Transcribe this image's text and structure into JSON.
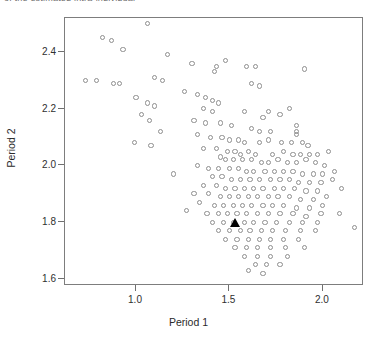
{
  "top_text": {
    "cut_off_line": "of the estimated intra-individual"
  },
  "figure": {
    "plot_box": {
      "left": 64,
      "top": 17,
      "width": 299,
      "height": 268
    }
  },
  "chart_data": {
    "type": "scatter",
    "title": "",
    "xlabel": "Period 1",
    "ylabel": "Period 2",
    "xlim": [
      0.62,
      2.22
    ],
    "ylim": [
      1.575,
      2.52
    ],
    "xticks": [
      1.0,
      1.5,
      2.0
    ],
    "xticklabels": [
      "1.0",
      "1.5",
      "2.0"
    ],
    "yticks": [
      1.6,
      1.8,
      2.0,
      2.2,
      2.4
    ],
    "yticklabels": [
      "1.6",
      "1.8",
      "2.0",
      "2.2",
      "2.4"
    ],
    "grid": false,
    "legend": null,
    "series": [
      {
        "name": "observations",
        "marker": "open-circle",
        "color": "#8e8e8e",
        "points": [
          [
            1.06,
            2.5
          ],
          [
            0.82,
            2.45
          ],
          [
            0.87,
            2.44
          ],
          [
            0.93,
            2.41
          ],
          [
            1.17,
            2.39
          ],
          [
            1.48,
            2.37
          ],
          [
            1.3,
            2.36
          ],
          [
            1.43,
            2.35
          ],
          [
            1.59,
            2.35
          ],
          [
            1.64,
            2.35
          ],
          [
            1.9,
            2.34
          ],
          [
            1.42,
            2.33
          ],
          [
            0.73,
            2.3
          ],
          [
            0.79,
            2.3
          ],
          [
            0.88,
            2.29
          ],
          [
            0.91,
            2.29
          ],
          [
            1.1,
            2.31
          ],
          [
            1.14,
            2.3
          ],
          [
            1.62,
            2.29
          ],
          [
            1.66,
            2.28
          ],
          [
            1.26,
            2.26
          ],
          [
            1.33,
            2.25
          ],
          [
            1.37,
            2.24
          ],
          [
            1.41,
            2.23
          ],
          [
            1.44,
            2.22
          ],
          [
            1.0,
            2.24
          ],
          [
            1.06,
            2.22
          ],
          [
            1.1,
            2.21
          ],
          [
            1.36,
            2.2
          ],
          [
            1.41,
            2.19
          ],
          [
            1.58,
            2.19
          ],
          [
            1.71,
            2.19
          ],
          [
            1.68,
            2.17
          ],
          [
            1.77,
            2.18
          ],
          [
            1.82,
            2.2
          ],
          [
            1.03,
            2.18
          ],
          [
            1.07,
            2.16
          ],
          [
            1.31,
            2.16
          ],
          [
            1.37,
            2.15
          ],
          [
            1.45,
            2.15
          ],
          [
            1.51,
            2.14
          ],
          [
            1.62,
            2.13
          ],
          [
            1.66,
            2.12
          ],
          [
            1.72,
            2.12
          ],
          [
            1.86,
            2.14
          ],
          [
            1.86,
            2.12
          ],
          [
            1.86,
            2.11
          ],
          [
            1.13,
            2.12
          ],
          [
            1.33,
            2.11
          ],
          [
            1.4,
            2.1
          ],
          [
            1.46,
            2.1
          ],
          [
            1.5,
            2.09
          ],
          [
            1.55,
            2.09
          ],
          [
            1.58,
            2.08
          ],
          [
            1.66,
            2.08
          ],
          [
            1.71,
            2.09
          ],
          [
            1.78,
            2.08
          ],
          [
            1.83,
            2.08
          ],
          [
            1.89,
            2.08
          ],
          [
            1.92,
            2.07
          ],
          [
            0.99,
            2.08
          ],
          [
            1.08,
            2.07
          ],
          [
            1.36,
            2.06
          ],
          [
            1.43,
            2.06
          ],
          [
            1.49,
            2.05
          ],
          [
            1.53,
            2.05
          ],
          [
            1.56,
            2.04
          ],
          [
            1.6,
            2.05
          ],
          [
            1.64,
            2.04
          ],
          [
            1.73,
            2.04
          ],
          [
            1.79,
            2.05
          ],
          [
            1.84,
            2.04
          ],
          [
            1.88,
            2.04
          ],
          [
            1.93,
            2.04
          ],
          [
            1.97,
            2.04
          ],
          [
            2.03,
            2.05
          ],
          [
            1.45,
            2.03
          ],
          [
            1.48,
            2.02
          ],
          [
            1.52,
            2.02
          ],
          [
            1.57,
            2.02
          ],
          [
            1.62,
            2.02
          ],
          [
            1.67,
            2.01
          ],
          [
            1.71,
            2.01
          ],
          [
            1.76,
            2.02
          ],
          [
            1.81,
            2.01
          ],
          [
            1.86,
            2.01
          ],
          [
            1.91,
            2.02
          ],
          [
            1.96,
            2.01
          ],
          [
            2.01,
            2.0
          ],
          [
            1.33,
            2.0
          ],
          [
            1.39,
            1.99
          ],
          [
            1.44,
            1.99
          ],
          [
            1.5,
            1.99
          ],
          [
            1.55,
            1.99
          ],
          [
            1.59,
            1.98
          ],
          [
            1.63,
            1.98
          ],
          [
            1.69,
            1.98
          ],
          [
            1.74,
            1.98
          ],
          [
            1.79,
            1.98
          ],
          [
            1.84,
            1.98
          ],
          [
            1.89,
            1.97
          ],
          [
            1.95,
            1.97
          ],
          [
            2.0,
            1.97
          ],
          [
            2.06,
            1.98
          ],
          [
            1.2,
            1.97
          ],
          [
            1.41,
            1.96
          ],
          [
            1.46,
            1.96
          ],
          [
            1.51,
            1.95
          ],
          [
            1.56,
            1.95
          ],
          [
            1.61,
            1.95
          ],
          [
            1.66,
            1.95
          ],
          [
            1.72,
            1.95
          ],
          [
            1.77,
            1.95
          ],
          [
            1.82,
            1.95
          ],
          [
            1.87,
            1.94
          ],
          [
            1.93,
            1.94
          ],
          [
            1.99,
            1.94
          ],
          [
            2.05,
            1.95
          ],
          [
            1.36,
            1.93
          ],
          [
            1.43,
            1.93
          ],
          [
            1.48,
            1.92
          ],
          [
            1.53,
            1.92
          ],
          [
            1.58,
            1.92
          ],
          [
            1.63,
            1.92
          ],
          [
            1.68,
            1.92
          ],
          [
            1.74,
            1.92
          ],
          [
            1.79,
            1.92
          ],
          [
            1.85,
            1.92
          ],
          [
            1.91,
            1.91
          ],
          [
            1.97,
            1.91
          ],
          [
            2.1,
            1.92
          ],
          [
            1.31,
            1.9
          ],
          [
            1.39,
            1.9
          ],
          [
            1.45,
            1.89
          ],
          [
            1.5,
            1.89
          ],
          [
            1.55,
            1.89
          ],
          [
            1.6,
            1.89
          ],
          [
            1.65,
            1.89
          ],
          [
            1.71,
            1.89
          ],
          [
            1.76,
            1.89
          ],
          [
            1.82,
            1.89
          ],
          [
            1.88,
            1.88
          ],
          [
            1.95,
            1.88
          ],
          [
            2.02,
            1.89
          ],
          [
            1.34,
            1.87
          ],
          [
            1.42,
            1.86
          ],
          [
            1.47,
            1.86
          ],
          [
            1.52,
            1.86
          ],
          [
            1.57,
            1.86
          ],
          [
            1.62,
            1.86
          ],
          [
            1.68,
            1.86
          ],
          [
            1.73,
            1.86
          ],
          [
            1.79,
            1.86
          ],
          [
            1.86,
            1.85
          ],
          [
            1.93,
            1.85
          ],
          [
            2.0,
            1.86
          ],
          [
            1.27,
            1.84
          ],
          [
            1.38,
            1.83
          ],
          [
            1.44,
            1.83
          ],
          [
            1.49,
            1.83
          ],
          [
            1.54,
            1.83
          ],
          [
            1.59,
            1.83
          ],
          [
            1.65,
            1.83
          ],
          [
            1.71,
            1.83
          ],
          [
            1.77,
            1.83
          ],
          [
            1.84,
            1.83
          ],
          [
            1.91,
            1.82
          ],
          [
            1.99,
            1.83
          ],
          [
            2.09,
            1.83
          ],
          [
            1.41,
            1.8
          ],
          [
            1.47,
            1.8
          ],
          [
            1.52,
            1.8
          ],
          [
            1.58,
            1.8
          ],
          [
            1.63,
            1.8
          ],
          [
            1.69,
            1.8
          ],
          [
            1.75,
            1.8
          ],
          [
            1.82,
            1.8
          ],
          [
            1.89,
            1.8
          ],
          [
            1.97,
            1.8
          ],
          [
            1.44,
            1.77
          ],
          [
            1.5,
            1.77
          ],
          [
            1.56,
            1.77
          ],
          [
            1.61,
            1.77
          ],
          [
            1.67,
            1.77
          ],
          [
            1.73,
            1.77
          ],
          [
            1.8,
            1.77
          ],
          [
            1.88,
            1.77
          ],
          [
            1.96,
            1.77
          ],
          [
            2.17,
            1.78
          ],
          [
            1.48,
            1.74
          ],
          [
            1.54,
            1.74
          ],
          [
            1.6,
            1.74
          ],
          [
            1.66,
            1.74
          ],
          [
            1.72,
            1.74
          ],
          [
            1.79,
            1.74
          ],
          [
            1.87,
            1.74
          ],
          [
            1.53,
            1.71
          ],
          [
            1.59,
            1.71
          ],
          [
            1.65,
            1.71
          ],
          [
            1.72,
            1.71
          ],
          [
            1.8,
            1.71
          ],
          [
            1.9,
            1.71
          ],
          [
            1.58,
            1.68
          ],
          [
            1.65,
            1.68
          ],
          [
            1.72,
            1.68
          ],
          [
            1.81,
            1.68
          ],
          [
            1.64,
            1.65
          ],
          [
            1.7,
            1.65
          ],
          [
            1.77,
            1.65
          ],
          [
            1.6,
            1.63
          ],
          [
            1.68,
            1.62
          ]
        ]
      },
      {
        "name": "highlighted-observation",
        "marker": "filled-triangle",
        "color": "#000000",
        "points": [
          [
            1.53,
            1.8
          ]
        ]
      }
    ]
  }
}
